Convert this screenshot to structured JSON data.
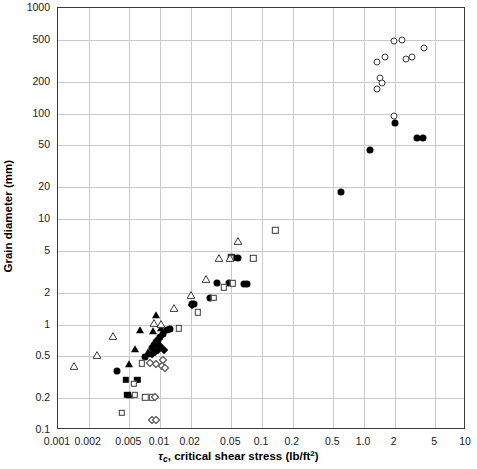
{
  "chart_data": {
    "type": "scatter",
    "title": "",
    "xlabel": "τc, critical shear stress (lb/ft2)",
    "ylabel": "Grain diameter (mm)",
    "xscale": "log",
    "yscale": "log",
    "xlim": [
      0.001,
      10
    ],
    "ylim": [
      0.1,
      1000
    ],
    "grid": true,
    "legend_position": "none",
    "xticks": [
      "0.001",
      "0.002",
      "0.005",
      "0.01",
      "0.02",
      "0.05",
      "0.1",
      "0.2",
      "0.5",
      "1.0",
      "2",
      "5",
      "10"
    ],
    "xtick_values": [
      0.001,
      0.002,
      0.005,
      0.01,
      0.02,
      0.05,
      0.1,
      0.2,
      0.5,
      1.0,
      2,
      5,
      10
    ],
    "yticks": [
      "1000",
      "500",
      "200",
      "100",
      "50",
      "20",
      "10",
      "5",
      "2",
      "1",
      "0.5",
      "0.2",
      "0.1"
    ],
    "ytick_values": [
      1000,
      500,
      200,
      100,
      50,
      20,
      10,
      5,
      2,
      1,
      0.5,
      0.2,
      0.1
    ],
    "series": [
      {
        "name": "open-circle",
        "marker": "open-circle",
        "points": [
          [
            1.35,
            170
          ],
          [
            1.35,
            310
          ],
          [
            1.45,
            215
          ],
          [
            1.5,
            195
          ],
          [
            1.62,
            345
          ],
          [
            1.95,
            490
          ],
          [
            2.35,
            495
          ],
          [
            2.6,
            330
          ],
          [
            2.95,
            345
          ],
          [
            3.9,
            420
          ],
          [
            1.95,
            95
          ]
        ]
      },
      {
        "name": "filled-circle",
        "marker": "filled-circle",
        "points": [
          [
            0.0038,
            0.36
          ],
          [
            0.0072,
            0.49
          ],
          [
            0.0083,
            0.6
          ],
          [
            0.0088,
            0.64
          ],
          [
            0.0092,
            0.68
          ],
          [
            0.0096,
            0.72
          ],
          [
            0.0101,
            0.76
          ],
          [
            0.0108,
            0.82
          ],
          [
            0.0118,
            0.88
          ],
          [
            0.0125,
            0.9
          ],
          [
            0.0205,
            1.55
          ],
          [
            0.0215,
            1.55
          ],
          [
            0.031,
            1.8
          ],
          [
            0.036,
            2.45
          ],
          [
            0.047,
            2.45
          ],
          [
            0.066,
            2.4
          ],
          [
            0.072,
            2.4
          ],
          [
            0.058,
            4.3
          ],
          [
            0.6,
            18
          ],
          [
            1.15,
            45
          ],
          [
            2.0,
            82
          ],
          [
            3.3,
            58
          ],
          [
            3.8,
            58
          ]
        ]
      },
      {
        "name": "filled-square",
        "marker": "filled-square",
        "points": [
          [
            0.0046,
            0.3
          ],
          [
            0.006,
            0.3
          ],
          [
            0.0048,
            0.215
          ],
          [
            0.05,
            4.35
          ],
          [
            0.053,
            4.3
          ]
        ]
      },
      {
        "name": "filled-triangle",
        "marker": "filled-triangle",
        "points": [
          [
            0.005,
            0.42
          ],
          [
            0.0051,
            0.215
          ],
          [
            0.0057,
            0.59
          ],
          [
            0.0064,
            0.88
          ],
          [
            0.0076,
            0.55
          ],
          [
            0.008,
            0.53
          ],
          [
            0.0086,
            0.86
          ],
          [
            0.0092,
            1.22
          ],
          [
            0.0102,
            0.93
          ]
        ]
      },
      {
        "name": "filled-diamond",
        "marker": "filled-diamond",
        "points": [
          [
            0.0083,
            0.53
          ],
          [
            0.009,
            0.55
          ],
          [
            0.0096,
            0.57
          ],
          [
            0.0101,
            0.62
          ],
          [
            0.011,
            0.57
          ],
          [
            0.0205,
            1.52
          ]
        ]
      },
      {
        "name": "open-square",
        "marker": "open-square",
        "points": [
          [
            0.0042,
            0.145
          ],
          [
            0.0057,
            0.215
          ],
          [
            0.0072,
            0.205
          ],
          [
            0.0084,
            0.205
          ],
          [
            0.0055,
            0.275
          ],
          [
            0.0066,
            0.43
          ],
          [
            0.0152,
            0.92
          ],
          [
            0.0235,
            1.3
          ],
          [
            0.0335,
            1.8
          ],
          [
            0.0425,
            2.25
          ],
          [
            0.052,
            2.45
          ],
          [
            0.082,
            4.25
          ],
          [
            0.135,
            7.8
          ],
          [
            0.0495,
            4.3
          ]
        ]
      },
      {
        "name": "open-diamond",
        "marker": "open-diamond",
        "points": [
          [
            0.008,
            0.43
          ],
          [
            0.0089,
            0.205
          ],
          [
            0.0092,
            0.42
          ],
          [
            0.0105,
            0.4
          ],
          [
            0.0108,
            0.46
          ],
          [
            0.0112,
            0.39
          ],
          [
            0.0084,
            0.125
          ],
          [
            0.0092,
            0.125
          ]
        ]
      },
      {
        "name": "open-triangle",
        "marker": "open-triangle",
        "points": [
          [
            0.00145,
            0.4
          ],
          [
            0.0024,
            0.51
          ],
          [
            0.0035,
            0.78
          ],
          [
            0.0088,
            1.03
          ],
          [
            0.0102,
            1.02
          ],
          [
            0.0137,
            1.42
          ],
          [
            0.0203,
            1.9
          ],
          [
            0.0282,
            2.7
          ],
          [
            0.0375,
            4.3
          ],
          [
            0.0487,
            4.3
          ],
          [
            0.058,
            6.2
          ]
        ]
      }
    ]
  }
}
